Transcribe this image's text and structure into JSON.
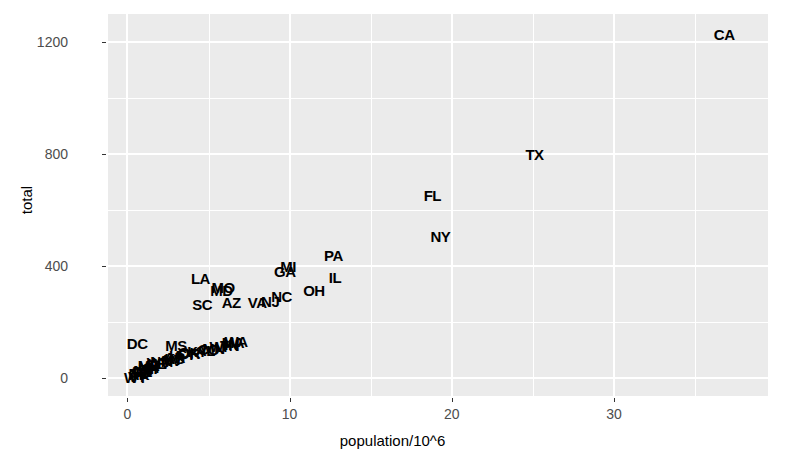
{
  "chart_data": {
    "type": "scatter",
    "title": "",
    "xlabel": "population/10^6",
    "ylabel": "total",
    "xlim": [
      -1.2,
      39.5
    ],
    "ylim": [
      -65,
      1300
    ],
    "x_ticks": [
      0,
      10,
      20,
      30
    ],
    "y_ticks": [
      0,
      400,
      800,
      1200
    ],
    "x_tick_labels": [
      "0",
      "10",
      "20",
      "30"
    ],
    "y_tick_labels": [
      "0",
      "400",
      "800",
      "1200"
    ],
    "grid": "white gridlines on grey panel",
    "legend": "none",
    "point_marker": "text label (state abbreviation)",
    "panel_bg": "#ebebeb",
    "grid_color": "#ffffff",
    "point_color": "#000000",
    "points": [
      {
        "label": "CA",
        "x": 36.8,
        "y": 1230
      },
      {
        "label": "TX",
        "x": 25.1,
        "y": 800
      },
      {
        "label": "FL",
        "x": 18.8,
        "y": 655
      },
      {
        "label": "NY",
        "x": 19.3,
        "y": 508
      },
      {
        "label": "PA",
        "x": 12.7,
        "y": 440
      },
      {
        "label": "MI",
        "x": 9.9,
        "y": 400
      },
      {
        "label": "GA",
        "x": 9.7,
        "y": 380
      },
      {
        "label": "IL",
        "x": 12.8,
        "y": 360
      },
      {
        "label": "LA",
        "x": 4.5,
        "y": 358
      },
      {
        "label": "MO",
        "x": 5.9,
        "y": 325
      },
      {
        "label": "MD",
        "x": 5.8,
        "y": 312
      },
      {
        "label": "OH",
        "x": 11.5,
        "y": 312
      },
      {
        "label": "NC",
        "x": 9.5,
        "y": 292
      },
      {
        "label": "NJ",
        "x": 8.8,
        "y": 275
      },
      {
        "label": "VA",
        "x": 8.0,
        "y": 272
      },
      {
        "label": "AZ",
        "x": 6.4,
        "y": 270
      },
      {
        "label": "SC",
        "x": 4.6,
        "y": 265
      },
      {
        "label": "WA",
        "x": 6.7,
        "y": 132
      },
      {
        "label": "MA",
        "x": 6.5,
        "y": 128
      },
      {
        "label": "IN",
        "x": 6.4,
        "y": 122
      },
      {
        "label": "TN",
        "x": 6.3,
        "y": 118
      },
      {
        "label": "WI",
        "x": 5.6,
        "y": 112
      },
      {
        "label": "MN",
        "x": 5.3,
        "y": 108
      },
      {
        "label": "CO",
        "x": 5.0,
        "y": 104
      },
      {
        "label": "AL",
        "x": 4.8,
        "y": 100
      },
      {
        "label": "KY",
        "x": 4.3,
        "y": 96
      },
      {
        "label": "OK",
        "x": 3.8,
        "y": 92
      },
      {
        "label": "OR",
        "x": 3.8,
        "y": 88
      },
      {
        "label": "CT",
        "x": 3.6,
        "y": 84
      },
      {
        "label": "IA",
        "x": 3.0,
        "y": 80
      },
      {
        "label": "MS",
        "x": 3.0,
        "y": 118
      },
      {
        "label": "AR",
        "x": 2.9,
        "y": 76
      },
      {
        "label": "KS",
        "x": 2.9,
        "y": 72
      },
      {
        "label": "UT",
        "x": 2.8,
        "y": 68
      },
      {
        "label": "NV",
        "x": 2.7,
        "y": 64
      },
      {
        "label": "NM",
        "x": 2.1,
        "y": 60
      },
      {
        "label": "WV",
        "x": 1.9,
        "y": 56
      },
      {
        "label": "NE",
        "x": 1.8,
        "y": 52
      },
      {
        "label": "ID",
        "x": 1.6,
        "y": 48
      },
      {
        "label": "ME",
        "x": 1.3,
        "y": 44
      },
      {
        "label": "NH",
        "x": 1.3,
        "y": 40
      },
      {
        "label": "HI",
        "x": 1.4,
        "y": 36
      },
      {
        "label": "RI",
        "x": 1.1,
        "y": 32
      },
      {
        "label": "MT",
        "x": 1.0,
        "y": 28
      },
      {
        "label": "DE",
        "x": 0.9,
        "y": 24
      },
      {
        "label": "SD",
        "x": 0.8,
        "y": 20
      },
      {
        "label": "ND",
        "x": 0.7,
        "y": 16
      },
      {
        "label": "AK",
        "x": 0.7,
        "y": 12
      },
      {
        "label": "VT",
        "x": 0.6,
        "y": 8
      },
      {
        "label": "WY",
        "x": 0.5,
        "y": 4
      },
      {
        "label": "DC",
        "x": 0.6,
        "y": 124
      }
    ]
  },
  "axis": {
    "x_title": "population/10^6",
    "y_title": "total"
  }
}
